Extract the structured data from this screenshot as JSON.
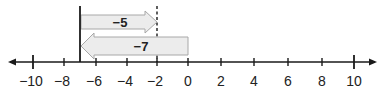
{
  "number_line": {
    "min": -10,
    "max": 10,
    "tick_labels": [
      "−10",
      "−8",
      "−6",
      "−4",
      "−2",
      "0",
      "2",
      "4",
      "6",
      "8",
      "10"
    ]
  },
  "arrows": [
    {
      "label": "−5",
      "from": -7,
      "to": -2,
      "direction": "right"
    },
    {
      "label": "−7",
      "from": 0,
      "to": -7,
      "direction": "left"
    }
  ],
  "markers": {
    "start_line_value": -7,
    "dashed_line_value": -2
  },
  "colors": {
    "arrow_fill": "#ececec",
    "arrow_stroke": "#a8a8a8",
    "line": "#1a1a1a"
  }
}
